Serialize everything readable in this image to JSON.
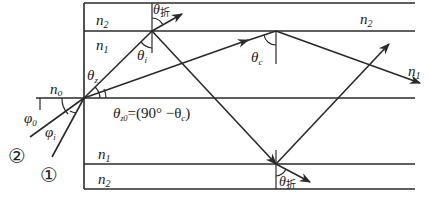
{
  "diagram": {
    "title": "",
    "layers": {
      "top_cladding": "n2",
      "top_core": "n1",
      "outside": "no",
      "bottom_core": "n1",
      "bottom_cladding": "n2"
    },
    "labels": {
      "n2_top_left": {
        "base": "n",
        "sub": "2"
      },
      "n1_top_left": {
        "base": "n",
        "sub": "1"
      },
      "n2_top_right": {
        "base": "n",
        "sub": "2"
      },
      "n1_right": {
        "base": "n",
        "sub": "1"
      },
      "n0": {
        "base": "n",
        "sub": "o"
      },
      "n1_bottom_left": {
        "base": "n",
        "sub": "1"
      },
      "n2_bottom_left": {
        "base": "n",
        "sub": "2"
      },
      "theta_z": {
        "base": "θ",
        "sub": "z"
      },
      "theta_i": {
        "base": "θ",
        "sub": "i"
      },
      "theta_c": {
        "base": "θ",
        "sub": "c"
      },
      "theta_refr_top": {
        "base": "θ",
        "sub": "折"
      },
      "theta_refr_bottom": {
        "base": "θ",
        "sub": "折"
      },
      "theta_z0": {
        "base": "θ",
        "sub": "z0",
        "rest": "=(90° −θ",
        "rest_sub": "c",
        "rest_end": ")"
      },
      "phi_0": {
        "base": "φ",
        "sub": "0"
      },
      "phi_i": {
        "base": "φ",
        "sub": "i"
      },
      "ray_1": "①",
      "ray_2": "②"
    },
    "colors": {
      "line": "#2a2a2a",
      "text": "#222222",
      "background": "#ffffff"
    }
  }
}
